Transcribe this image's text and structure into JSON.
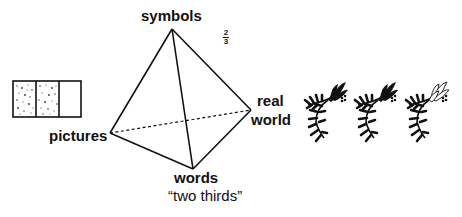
{
  "diagram": {
    "type": "tetrahedron",
    "vertices": {
      "top": {
        "label": "symbols"
      },
      "left": {
        "label": "pictures"
      },
      "bottom": {
        "label": "words"
      },
      "right": {
        "label_line1": "real",
        "label_line2": "world"
      }
    },
    "hidden_edge": "pictures-real world (dashed)"
  },
  "fraction": {
    "numerator": "2",
    "denominator": "3"
  },
  "caption": "“two thirds”",
  "picture_box": {
    "segments": 3,
    "shaded_segments": 2
  },
  "real_world_items": {
    "count": 3,
    "icon": "flower-branch-icon",
    "highlighted_index": 2
  },
  "colors": {
    "ink": "#111111",
    "background": "#ffffff"
  }
}
